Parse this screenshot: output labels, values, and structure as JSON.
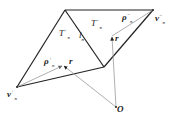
{
  "diagram": {
    "labels": {
      "T_plus": {
        "base": "T",
        "sup": "+",
        "sub": "n"
      },
      "T_minus": {
        "base": "T",
        "sup": "−",
        "sub": "n"
      },
      "l_n": {
        "base": "l",
        "sub": "n"
      },
      "rho_plus": {
        "base": "ρ",
        "sup": "+",
        "sub": "n"
      },
      "rho_minus": {
        "base": "ρ",
        "sup": "−",
        "sub": "n"
      },
      "v_plus": {
        "base": "v",
        "sup": "+",
        "sub": "n"
      },
      "v_minus": {
        "base": "v",
        "sup": "−",
        "sub": "n"
      },
      "r_left": {
        "base": "r"
      },
      "r_right": {
        "base": "r"
      },
      "origin": {
        "base": "O"
      }
    },
    "colors": {
      "edge": "#222222",
      "vector": "#999999"
    }
  }
}
